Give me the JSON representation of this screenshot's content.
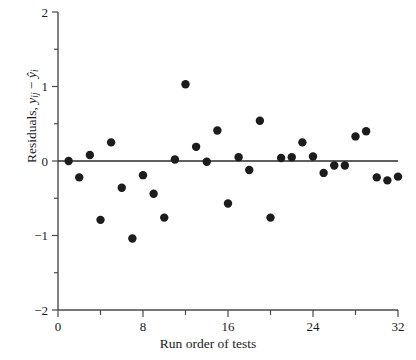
{
  "chart_data": {
    "type": "scatter",
    "title": "",
    "xlabel": "Run order of tests",
    "ylabel": "Residuals, yij − ŷi",
    "ylabel_parts": {
      "prefix": "Residuals, ",
      "term1": "y",
      "term1_sub": "ij",
      "minus": " − ",
      "term2": "ŷ",
      "term2_sub": "i"
    },
    "xlim": [
      0,
      32
    ],
    "ylim": [
      -2,
      2
    ],
    "x_major_ticks": [
      0,
      8,
      16,
      24,
      32
    ],
    "x_major_tick_labels": [
      "0",
      "8",
      "16",
      "24",
      "32"
    ],
    "x_minor_ticks": [
      4,
      12,
      20,
      28
    ],
    "y_major_ticks": [
      -2,
      -1,
      0,
      1,
      2
    ],
    "y_major_tick_labels": [
      "−2",
      "−1",
      "0",
      "1",
      "2"
    ],
    "y_minor_ticks": [
      -1.5,
      -0.5,
      0.5,
      1.5
    ],
    "grid": false,
    "legend": false,
    "reference_line": {
      "y": 0,
      "from_x": 0,
      "to_x": 32
    },
    "marker": {
      "shape": "circle",
      "radius": 4.2,
      "color": "#1c1c1c"
    },
    "x": [
      1,
      2,
      3,
      4,
      5,
      6,
      7,
      8,
      9,
      10,
      11,
      12,
      13,
      14,
      15,
      16,
      17,
      18,
      19,
      20,
      21,
      22,
      23,
      24,
      25,
      26,
      27,
      28,
      29,
      30,
      31,
      32
    ],
    "y": [
      0.0,
      -0.22,
      0.08,
      -0.79,
      0.25,
      -0.36,
      -1.04,
      -0.19,
      -0.44,
      -0.76,
      0.02,
      1.03,
      0.19,
      -0.01,
      0.41,
      -0.57,
      0.05,
      -0.12,
      0.54,
      -0.76,
      0.04,
      0.05,
      0.25,
      0.06,
      -0.16,
      -0.06,
      -0.06,
      0.33,
      0.4,
      -0.22,
      -0.26,
      -0.21
    ],
    "points": [
      {
        "x": 1,
        "y": 0.0
      },
      {
        "x": 2,
        "y": -0.22
      },
      {
        "x": 3,
        "y": 0.08
      },
      {
        "x": 4,
        "y": -0.79
      },
      {
        "x": 5,
        "y": 0.25
      },
      {
        "x": 6,
        "y": -0.36
      },
      {
        "x": 7,
        "y": -1.04
      },
      {
        "x": 8,
        "y": -0.19
      },
      {
        "x": 9,
        "y": -0.44
      },
      {
        "x": 10,
        "y": -0.76
      },
      {
        "x": 11,
        "y": 0.02
      },
      {
        "x": 12,
        "y": 1.03
      },
      {
        "x": 13,
        "y": 0.19
      },
      {
        "x": 14,
        "y": -0.01
      },
      {
        "x": 15,
        "y": 0.41
      },
      {
        "x": 16,
        "y": -0.57
      },
      {
        "x": 17,
        "y": 0.05
      },
      {
        "x": 18,
        "y": -0.12
      },
      {
        "x": 19,
        "y": 0.54
      },
      {
        "x": 20,
        "y": -0.76
      },
      {
        "x": 21,
        "y": 0.04
      },
      {
        "x": 22,
        "y": 0.05
      },
      {
        "x": 23,
        "y": 0.25
      },
      {
        "x": 24,
        "y": 0.06
      },
      {
        "x": 25,
        "y": -0.16
      },
      {
        "x": 26,
        "y": -0.06
      },
      {
        "x": 27,
        "y": -0.06
      },
      {
        "x": 28,
        "y": 0.33
      },
      {
        "x": 29,
        "y": 0.4
      },
      {
        "x": 30,
        "y": -0.22
      },
      {
        "x": 31,
        "y": -0.26
      },
      {
        "x": 32,
        "y": -0.21
      }
    ]
  },
  "colors": {
    "background": "#ffffff",
    "axis": "#4a4a4a",
    "marker": "#1c1c1c",
    "reference_line": "#2b2b2b",
    "text": "#1a1a1a"
  },
  "geometry": {
    "plot_left": 58,
    "plot_right": 398,
    "plot_top": 12,
    "plot_bottom": 310
  }
}
